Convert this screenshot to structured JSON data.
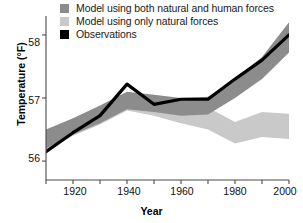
{
  "chart_data": {
    "type": "line",
    "title": "",
    "xlabel": "Year",
    "ylabel": "Temperature (°F)",
    "xlim": [
      1910,
      2000
    ],
    "ylim": [
      55.7,
      58.3
    ],
    "xticks": [
      1920,
      1940,
      1960,
      1980,
      2000
    ],
    "yticks": [
      56,
      57,
      58
    ],
    "grid": false,
    "legend_position": "top-left",
    "legend": [
      {
        "label": "Model using both natural and human forces",
        "color": "#8c8c8c",
        "marker": "square"
      },
      {
        "label": "Model using only natural forces",
        "color": "#c9c9c9",
        "marker": "square"
      },
      {
        "label": "Observations",
        "color": "#000000",
        "marker": "square"
      }
    ],
    "x": [
      1910,
      1920,
      1930,
      1940,
      1950,
      1960,
      1970,
      1980,
      1990,
      2000
    ],
    "series": [
      {
        "name": "Observations",
        "type": "line",
        "color": "#000000",
        "values": [
          56.15,
          56.45,
          56.72,
          57.22,
          56.9,
          56.98,
          56.98,
          57.3,
          57.6,
          58.0
        ]
      },
      {
        "name": "Model using both natural and human forces",
        "type": "band",
        "color": "#8c8c8c",
        "lower": [
          56.2,
          56.42,
          56.6,
          56.82,
          56.78,
          56.72,
          56.74,
          57.0,
          57.3,
          57.72
        ],
        "upper": [
          56.5,
          56.68,
          56.88,
          57.1,
          57.05,
          57.0,
          57.02,
          57.3,
          57.65,
          58.2
        ]
      },
      {
        "name": "Model using only natural forces",
        "type": "band",
        "color": "#c9c9c9",
        "lower": [
          56.18,
          56.4,
          56.58,
          56.8,
          56.72,
          56.6,
          56.5,
          56.28,
          56.38,
          56.35
        ],
        "upper": [
          56.48,
          56.66,
          56.86,
          57.08,
          57.0,
          56.92,
          56.85,
          56.62,
          56.78,
          56.75
        ]
      }
    ]
  },
  "legend": {
    "item1": "Model using both natural and human forces",
    "item2": "Model using only natural forces",
    "item3": "Observations"
  },
  "axes": {
    "ylabel": "Temperature (°F)",
    "xlabel": "Year",
    "ytick_58": "58",
    "ytick_57": "57",
    "ytick_56": "56",
    "xtick_1920": "1920",
    "xtick_1940": "1940",
    "xtick_1960": "1960",
    "xtick_1980": "1980",
    "xtick_2000": "2000"
  },
  "colors": {
    "band_both": "#8c8c8c",
    "band_natural": "#c9c9c9",
    "observations": "#000000",
    "axis": "#4a4a4a",
    "background": "#ffffff"
  }
}
